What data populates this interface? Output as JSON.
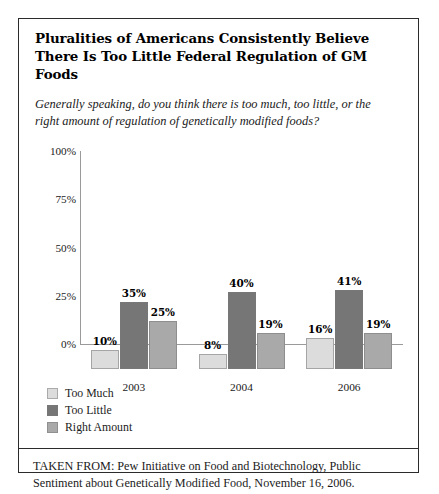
{
  "figure": {
    "title": "Pluralities of Americans Consistently Believe There Is Too Little Federal Regulation of GM Foods",
    "subtitle": "Generally speaking, do you think there is too much, too little, or the right amount of regulation of genetically modified foods?",
    "source_line_1": "TAKEN FROM: Pew Initiative on Food and Biotechnology, Public",
    "source_line_2": "Sentiment about Genetically Modified Food, November 16, 2006."
  },
  "colors": {
    "too_much": "#dcdcdc",
    "too_little": "#767676",
    "right_amount": "#a9a9a9",
    "axis": "#9a9a9a",
    "border": "#2b2b2b"
  },
  "chart_data": {
    "type": "bar",
    "title": "Pluralities of Americans Consistently Believe There Is Too Little Federal Regulation of GM Foods",
    "subtitle": "Generally speaking, do you think there is too much, too little, or the right amount of regulation of genetically modified foods?",
    "categories": [
      "2003",
      "2004",
      "2006"
    ],
    "series": [
      {
        "name": "Too Much",
        "values": [
          10,
          8,
          16
        ],
        "labels": [
          "10%",
          "8%",
          "16%"
        ],
        "color": "#dcdcdc"
      },
      {
        "name": "Too Little",
        "values": [
          35,
          40,
          41
        ],
        "labels": [
          "35%",
          "40%",
          "41%"
        ],
        "color": "#767676"
      },
      {
        "name": "Right Amount",
        "values": [
          25,
          19,
          19
        ],
        "labels": [
          "25%",
          "19%",
          "19%"
        ],
        "color": "#a9a9a9"
      }
    ],
    "xlabel": "",
    "ylabel": "",
    "ylim": [
      0,
      100
    ],
    "ytick_labels": [
      "0%",
      "25%",
      "50%",
      "75%",
      "100%"
    ],
    "ytick_values": [
      0,
      25,
      50,
      75,
      100
    ],
    "grid": false,
    "legend_position": "bottom-left",
    "value_labels": true
  }
}
